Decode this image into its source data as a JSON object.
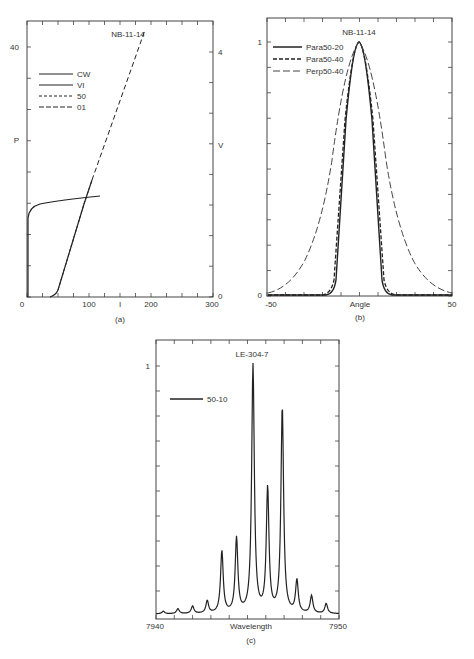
{
  "chart_data": [
    {
      "id": "a",
      "type": "line",
      "title": "NB-11-14",
      "caption": "(a)",
      "xlabel": "I",
      "ylabel_left": "P",
      "ylabel_right": "V",
      "x_ticks": [
        "0",
        "100",
        "200",
        "300"
      ],
      "y_left_ticks": [
        "40"
      ],
      "y_right_ticks": [
        "0",
        "4"
      ],
      "xlim": [
        0,
        300
      ],
      "ylim_left": [
        0,
        45
      ],
      "ylim_right": [
        0,
        4.5
      ],
      "legend": [
        "CW",
        "VI",
        "50",
        "01"
      ],
      "legend_styles": [
        "solid",
        "solid",
        "short-dash",
        "long-dash"
      ],
      "legend_position": "upper-left",
      "series": [
        {
          "name": "CW",
          "style": "solid",
          "x": [
            2,
            2,
            3,
            8,
            20,
            50,
            80,
            120
          ],
          "y": [
            0,
            10,
            15,
            17.5,
            18.3,
            19,
            19.6,
            20.3
          ]
        },
        {
          "name": "VI",
          "style": "solid",
          "x": [
            40,
            45,
            55,
            70,
            90,
            100
          ],
          "y": [
            0,
            0.1,
            0.8,
            1.6,
            2.7,
            3.3
          ]
        },
        {
          "name": "50",
          "style": "short-dash",
          "x": [
            55,
            70,
            90,
            100
          ],
          "y": [
            0.8,
            1.6,
            2.7,
            3.3
          ]
        },
        {
          "name": "01",
          "style": "long-dash",
          "x": [
            45,
            70,
            100,
            130,
            160,
            190
          ],
          "y": [
            0,
            1.6,
            3.3,
            5.0,
            6.8,
            8.4
          ]
        }
      ]
    },
    {
      "id": "b",
      "type": "line",
      "title": "NB-11-14",
      "caption": "(b)",
      "xlabel": "Angle",
      "x_ticks": [
        "-50",
        "50"
      ],
      "y_ticks": [
        "0",
        "1"
      ],
      "xlim": [
        -50,
        50
      ],
      "ylim": [
        0,
        1.1
      ],
      "legend": [
        "Para50-20",
        "Para50-40",
        "Perp50-40"
      ],
      "legend_styles": [
        "solid",
        "dash",
        "long-dash"
      ],
      "legend_position": "upper-left",
      "series": [
        {
          "name": "Para50-20",
          "style": "solid",
          "x": [
            -50,
            -15,
            -10,
            -8,
            -5,
            -2,
            0,
            2,
            5,
            8,
            10,
            15,
            50
          ],
          "y": [
            0,
            0,
            0.02,
            0.15,
            0.55,
            0.92,
            1.0,
            0.92,
            0.55,
            0.15,
            0.02,
            0,
            0
          ]
        },
        {
          "name": "Para50-40",
          "style": "dash",
          "x": [
            -50,
            -16,
            -11,
            -9,
            -6,
            -2,
            0,
            2,
            6,
            9,
            11,
            16,
            50
          ],
          "y": [
            0,
            0,
            0.03,
            0.18,
            0.58,
            0.93,
            1.0,
            0.93,
            0.58,
            0.18,
            0.03,
            0,
            0
          ]
        },
        {
          "name": "Perp50-40",
          "style": "long-dash",
          "x": [
            -50,
            -40,
            -30,
            -20,
            -12,
            -6,
            0,
            6,
            12,
            20,
            30,
            40,
            50
          ],
          "y": [
            0.02,
            0.06,
            0.15,
            0.32,
            0.58,
            0.85,
            1.0,
            0.85,
            0.58,
            0.32,
            0.15,
            0.06,
            0.02
          ]
        }
      ]
    },
    {
      "id": "c",
      "type": "line",
      "title": "LE-304-7",
      "caption": "(c)",
      "xlabel": "Wavelength",
      "x_ticks": [
        "7940",
        "7950"
      ],
      "y_ticks": [
        "1"
      ],
      "xlim": [
        7940,
        7950
      ],
      "ylim": [
        0,
        1.2
      ],
      "legend": [
        "50-10"
      ],
      "legend_position": "upper-left",
      "series": [
        {
          "name": "50-10",
          "style": "solid",
          "peaks_x": [
            7940.4,
            7941.2,
            7942.0,
            7942.8,
            7943.6,
            7944.4,
            7945.3,
            7946.1,
            7946.9,
            7947.7,
            7948.5,
            7949.3
          ],
          "peaks_y": [
            0.01,
            0.02,
            0.03,
            0.05,
            0.25,
            0.3,
            1.0,
            0.5,
            0.83,
            0.13,
            0.07,
            0.04
          ]
        }
      ]
    }
  ],
  "figure": {
    "captions": [
      "(a)",
      "(b)",
      "(c)"
    ]
  }
}
